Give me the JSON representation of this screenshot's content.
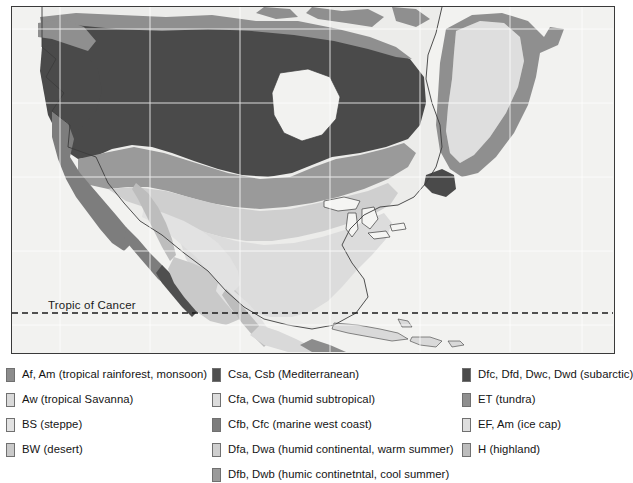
{
  "map": {
    "title": "",
    "tropic_label": "Tropic of Cancer",
    "frame_color": "#3a3a3a",
    "ocean_color": "#f2f2f0",
    "gridline_color": "#ffffff",
    "coastline_color": "#3c3c3c"
  },
  "palette": {
    "af_am": "#8c8c8c",
    "aw": "#d9d9d9",
    "bs": "#e2e2e2",
    "bw": "#c9c9c9",
    "csa_csb": "#4f4f4f",
    "cfa_cwa": "#dcdcdc",
    "cfb_cfc": "#7d7d7d",
    "dfa_dwa": "#cfcfcf",
    "dfb_dwb": "#9a9a9a",
    "dfc_subarctic": "#4a4a4a",
    "et_tundra": "#8f8f8f",
    "ef_am": "#dedede",
    "h_highland": "#bdbdbd"
  },
  "legend": {
    "columns": [
      {
        "name": "legend-column-tropical-dry",
        "items": [
          {
            "swatch": "#8c8c8c",
            "label": "Af, Am (tropical rainforest, monsoon)"
          },
          {
            "swatch": "#d9d9d9",
            "label": "Aw (tropical Savanna)"
          },
          {
            "swatch": "#e2e2e2",
            "label": "BS (steppe)"
          },
          {
            "swatch": "#c9c9c9",
            "label": "BW (desert)"
          }
        ]
      },
      {
        "name": "legend-column-temperate-continental",
        "items": [
          {
            "swatch": "#4f4f4f",
            "label": "Csa, Csb (Mediterranean)"
          },
          {
            "swatch": "#dcdcdc",
            "label": "Cfa, Cwa (humid subtropical)"
          },
          {
            "swatch": "#7d7d7d",
            "label": "Cfb, Cfc (marine west coast)"
          },
          {
            "swatch": "#cfcfcf",
            "label": "Dfa, Dwa (humid continental, warm summer)"
          },
          {
            "swatch": "#9a9a9a",
            "label": "Dfb, Dwb (humic continetntal, cool summer)"
          }
        ]
      },
      {
        "name": "legend-column-polar-highland",
        "items": [
          {
            "swatch": "#4a4a4a",
            "label": "Dfc, Dfd, Dwc, Dwd (subarctic)"
          },
          {
            "swatch": "#8f8f8f",
            "label": "ET (tundra)"
          },
          {
            "swatch": "#dedede",
            "label": "EF, Am (ice cap)"
          },
          {
            "swatch": "#bdbdbd",
            "label": "H (highland)"
          }
        ]
      }
    ]
  }
}
